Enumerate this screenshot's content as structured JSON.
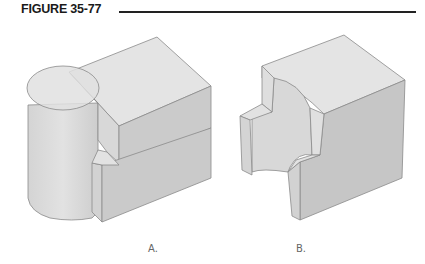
{
  "figure": {
    "title": "FIGURE 35-77"
  },
  "panels": [
    {
      "label": "A.",
      "description": "Block with cylinder union"
    },
    {
      "label": "B.",
      "description": "Block with cylindrical cut"
    }
  ],
  "colors": {
    "top_face": "#e4e4e4",
    "left_face": "#d6d6d6",
    "right_face": "#c9c9c9",
    "edge": "#8a8a8a",
    "title_rule": "#222222"
  }
}
